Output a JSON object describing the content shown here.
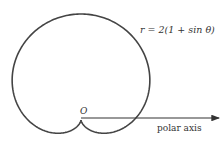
{
  "figure": {
    "equation_label": "r = 2(1 + sin θ)",
    "origin_label": "O",
    "axis_label": "polar axis"
  },
  "chart_data": {
    "type": "line",
    "title": "",
    "coordinate_system": "polar",
    "equation": "r = 2(1 + sin θ)",
    "curve": "cardioid",
    "a": 2,
    "theta_range_deg": [
      0,
      360
    ],
    "annotations": [
      "r = 2(1 + sin θ)",
      "O",
      "polar axis"
    ],
    "sample_points_polar": [
      {
        "theta_deg": -90,
        "r": 0
      },
      {
        "theta_deg": -60,
        "r": 0.268
      },
      {
        "theta_deg": -30,
        "r": 1
      },
      {
        "theta_deg": 0,
        "r": 2
      },
      {
        "theta_deg": 30,
        "r": 3
      },
      {
        "theta_deg": 60,
        "r": 3.732
      },
      {
        "theta_deg": 90,
        "r": 4
      },
      {
        "theta_deg": 120,
        "r": 3.732
      },
      {
        "theta_deg": 150,
        "r": 3
      },
      {
        "theta_deg": 180,
        "r": 2
      },
      {
        "theta_deg": 210,
        "r": 1
      },
      {
        "theta_deg": 240,
        "r": 0.268
      }
    ],
    "render": {
      "origin_px": [
        81,
        120
      ],
      "scale_px": 26.5,
      "stroke": "#444444",
      "stroke_width": 1.6,
      "axis_end_px": [
        219,
        118
      ]
    }
  }
}
